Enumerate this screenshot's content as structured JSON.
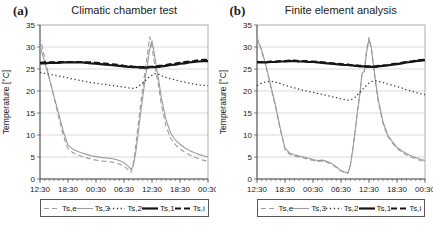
{
  "colors": {
    "grid": "#c9c9c9",
    "axis": "#5a5a5a",
    "plot_border": "#9a9a9a",
    "text": "#1a1a1a",
    "background": "#ffffff",
    "gray_series": "#9c9c9c",
    "black_series": "#161616"
  },
  "chart_data": [
    {
      "type": "line",
      "panel_label": "(a)",
      "title": "Climatic chamber test",
      "ylabel": "Temperature [°C]",
      "ylim": [
        0,
        35
      ],
      "yticks": [
        0,
        5,
        10,
        15,
        20,
        25,
        30,
        35
      ],
      "grid": "horizontal",
      "legend_position": "bottom",
      "xtick_labels": [
        "12:30",
        "18:30",
        "00:30",
        "06:30",
        "12:30",
        "18:30",
        "00:30"
      ],
      "xtick_hours": [
        0,
        6,
        12,
        18,
        24,
        30,
        36
      ],
      "minor_tick_hours": 1,
      "x": [
        0,
        1,
        2,
        3,
        4,
        5,
        6,
        7,
        8,
        9,
        10,
        11,
        12,
        13,
        14,
        15,
        16,
        17,
        18,
        19,
        19.5,
        20,
        20.5,
        21,
        21.5,
        22,
        22.5,
        23,
        23.5,
        24,
        24.5,
        25,
        25.5,
        26,
        27,
        28,
        29,
        30,
        31,
        32,
        33,
        34,
        35,
        36
      ],
      "series": [
        {
          "name": "Ts,e",
          "color": "#9c9c9c",
          "dash": "5,3",
          "width": 1.1,
          "y": [
            32.4,
            27.5,
            23.0,
            18.5,
            14.0,
            9.8,
            6.9,
            6.0,
            5.5,
            5.1,
            4.8,
            4.5,
            4.3,
            4.1,
            4.0,
            3.9,
            3.7,
            3.4,
            2.9,
            2.0,
            1.5,
            3.5,
            7.5,
            12.0,
            16.5,
            20.5,
            24.5,
            28.0,
            32.3,
            30.0,
            26.5,
            23.5,
            20.5,
            17.0,
            12.0,
            9.2,
            7.8,
            6.8,
            6.1,
            5.5,
            5.0,
            4.6,
            4.3,
            4.0
          ]
        },
        {
          "name": "Ts,3",
          "color": "#9c9c9c",
          "dash": "",
          "width": 1.1,
          "y": [
            30.3,
            26.5,
            22.8,
            18.8,
            14.8,
            10.8,
            7.7,
            6.8,
            6.3,
            5.9,
            5.6,
            5.3,
            5.1,
            4.9,
            4.8,
            4.7,
            4.5,
            4.2,
            3.7,
            2.8,
            2.2,
            3.0,
            6.0,
            10.0,
            14.5,
            18.5,
            22.5,
            26.0,
            29.5,
            31.4,
            28.5,
            25.0,
            22.0,
            18.5,
            13.5,
            10.4,
            8.9,
            7.9,
            7.1,
            6.5,
            6.0,
            5.6,
            5.3,
            5.0
          ]
        },
        {
          "name": "Ts,2",
          "color": "#3a3a3a",
          "dash": "1.3,2.6",
          "width": 1.3,
          "y": [
            24.2,
            24.0,
            23.8,
            23.6,
            23.4,
            23.2,
            23.0,
            22.7,
            22.5,
            22.3,
            22.1,
            21.9,
            21.8,
            21.6,
            21.5,
            21.3,
            21.2,
            21.0,
            20.9,
            20.7,
            20.7,
            20.6,
            20.7,
            21.0,
            21.4,
            21.8,
            22.3,
            22.8,
            23.2,
            23.6,
            23.9,
            24.0,
            23.8,
            23.5,
            23.1,
            22.8,
            22.5,
            22.2,
            22.0,
            21.8,
            21.6,
            21.4,
            21.3,
            21.2
          ]
        },
        {
          "name": "Ts,1",
          "color": "#161616",
          "dash": "",
          "width": 2.2,
          "y": [
            26.3,
            26.3,
            26.4,
            26.4,
            26.4,
            26.5,
            26.5,
            26.5,
            26.5,
            26.5,
            26.4,
            26.3,
            26.2,
            26.1,
            26.0,
            25.9,
            25.8,
            25.7,
            25.6,
            25.5,
            25.5,
            25.4,
            25.4,
            25.4,
            25.3,
            25.3,
            25.3,
            25.3,
            25.4,
            25.4,
            25.4,
            25.5,
            25.5,
            25.6,
            25.7,
            25.9,
            26.0,
            26.2,
            26.3,
            26.5,
            26.6,
            26.7,
            26.8,
            26.8
          ]
        },
        {
          "name": "Ts,i",
          "color": "#161616",
          "dash": "6,3",
          "width": 2.2,
          "y": [
            26.4,
            26.5,
            26.5,
            26.5,
            26.6,
            26.6,
            26.6,
            26.6,
            26.6,
            26.6,
            26.5,
            26.5,
            26.4,
            26.3,
            26.2,
            26.1,
            26.0,
            25.9,
            25.7,
            25.6,
            25.6,
            25.5,
            25.5,
            25.5,
            25.4,
            25.4,
            25.4,
            25.4,
            25.5,
            25.5,
            25.6,
            25.6,
            25.7,
            25.7,
            25.9,
            26.1,
            26.2,
            26.4,
            26.6,
            26.7,
            26.8,
            27.0,
            27.1,
            27.1
          ]
        }
      ]
    },
    {
      "type": "line",
      "panel_label": "(b)",
      "title": "Finite element analysis",
      "ylabel": "Temperature [°C]",
      "ylim": [
        0,
        35
      ],
      "yticks": [
        0,
        5,
        10,
        15,
        20,
        25,
        30,
        35
      ],
      "grid": "horizontal",
      "legend_position": "bottom",
      "xtick_labels": [
        "12:30",
        "18:30",
        "00:30",
        "06:30",
        "12:30",
        "18:30",
        "00:30"
      ],
      "xtick_hours": [
        0,
        6,
        12,
        18,
        24,
        30,
        36
      ],
      "minor_tick_hours": 1,
      "x": [
        0,
        1,
        2,
        3,
        4,
        5,
        6,
        7,
        8,
        9,
        10,
        11,
        12,
        13,
        14,
        15,
        16,
        17,
        18,
        19,
        19.5,
        20,
        20.5,
        21,
        21.5,
        22,
        22.5,
        23,
        23.5,
        24,
        24.5,
        25,
        25.5,
        26,
        27,
        28,
        29,
        30,
        31,
        32,
        33,
        34,
        35,
        36
      ],
      "series": [
        {
          "name": "Ts,e",
          "color": "#9c9c9c",
          "dash": "5,3",
          "width": 1.1,
          "y": [
            32.3,
            29.0,
            25.2,
            20.7,
            16.2,
            11.2,
            6.7,
            5.6,
            5.2,
            5.0,
            4.8,
            4.5,
            4.2,
            4.0,
            4.1,
            3.8,
            3.3,
            2.6,
            1.8,
            1.4,
            1.3,
            3.2,
            6.8,
            10.8,
            15.3,
            19.3,
            23.8,
            24.4,
            29.5,
            32.2,
            29.5,
            25.0,
            21.0,
            17.5,
            12.6,
            9.7,
            8.2,
            6.9,
            6.1,
            5.5,
            5.0,
            4.6,
            4.2,
            4.0
          ]
        },
        {
          "name": "Ts,3",
          "color": "#9c9c9c",
          "dash": "",
          "width": 1.1,
          "y": [
            32.0,
            29.3,
            25.5,
            21.0,
            16.5,
            11.5,
            7.0,
            5.9,
            5.5,
            5.2,
            5.0,
            4.7,
            4.4,
            4.2,
            4.3,
            4.0,
            3.5,
            2.8,
            1.9,
            1.5,
            1.4,
            3.0,
            6.5,
            10.5,
            15.0,
            19.0,
            24.0,
            24.5,
            29.0,
            31.7,
            30.0,
            25.5,
            21.5,
            18.0,
            13.0,
            10.0,
            8.5,
            7.2,
            6.4,
            5.8,
            5.3,
            4.9,
            4.5,
            4.2
          ]
        },
        {
          "name": "Ts,2",
          "color": "#3a3a3a",
          "dash": "1.3,2.6",
          "width": 1.3,
          "y": [
            21.2,
            21.8,
            22.1,
            22.2,
            22.0,
            21.7,
            21.3,
            21.0,
            20.7,
            20.4,
            20.1,
            19.9,
            19.7,
            19.4,
            19.2,
            19.0,
            18.7,
            18.5,
            18.2,
            18.0,
            17.9,
            18.0,
            18.2,
            18.6,
            19.1,
            19.6,
            20.2,
            20.8,
            21.3,
            21.8,
            22.1,
            22.3,
            22.3,
            22.2,
            21.9,
            21.6,
            21.3,
            21.0,
            20.7,
            20.3,
            20.0,
            19.7,
            19.4,
            19.2
          ]
        },
        {
          "name": "Ts,1",
          "color": "#161616",
          "dash": "",
          "width": 2.2,
          "y": [
            26.5,
            26.5,
            26.5,
            26.6,
            26.6,
            26.7,
            26.7,
            26.8,
            26.8,
            26.7,
            26.7,
            26.6,
            26.6,
            26.5,
            26.4,
            26.3,
            26.2,
            26.1,
            26.0,
            25.9,
            25.9,
            25.8,
            25.8,
            25.7,
            25.7,
            25.6,
            25.6,
            25.6,
            25.5,
            25.5,
            25.5,
            25.5,
            25.5,
            25.6,
            25.7,
            25.8,
            26.0,
            26.1,
            26.3,
            26.5,
            26.6,
            26.8,
            26.9,
            27.0
          ]
        },
        {
          "name": "Ts,i",
          "color": "#161616",
          "dash": "6,3",
          "width": 2.2,
          "y": [
            26.6,
            26.6,
            26.6,
            26.7,
            26.7,
            26.8,
            26.8,
            26.9,
            26.9,
            26.8,
            26.8,
            26.7,
            26.7,
            26.6,
            26.5,
            26.4,
            26.3,
            26.2,
            26.1,
            26.0,
            26.0,
            25.9,
            25.9,
            25.8,
            25.8,
            25.7,
            25.7,
            25.7,
            25.6,
            25.6,
            25.6,
            25.6,
            25.6,
            25.7,
            25.8,
            25.9,
            26.1,
            26.2,
            26.4,
            26.6,
            26.7,
            26.9,
            27.0,
            27.1
          ]
        }
      ]
    }
  ]
}
